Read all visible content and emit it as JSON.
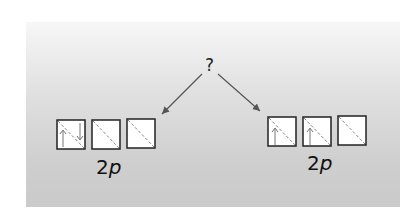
{
  "diagram": {
    "question_mark": "?",
    "left_group": {
      "label_number": "2",
      "label_letter": "p",
      "orbitals": [
        {
          "electrons": [
            "up",
            "down"
          ]
        },
        {
          "electrons": []
        },
        {
          "electrons": []
        }
      ]
    },
    "right_group": {
      "label_number": "2",
      "label_letter": "p",
      "orbitals": [
        {
          "electrons": [
            "up"
          ]
        },
        {
          "electrons": [
            "up"
          ]
        },
        {
          "electrons": []
        }
      ]
    },
    "colors": {
      "box_border": "#222222",
      "box_fill": "#ffffff",
      "arrow": "#555555",
      "background_top": "#f7f7f7",
      "background_bottom": "#cacaca"
    }
  }
}
